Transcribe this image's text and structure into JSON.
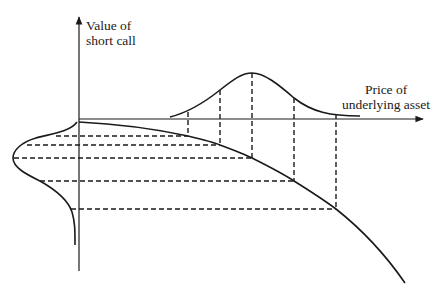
{
  "diagram": {
    "type": "option-value-distribution",
    "y_axis": {
      "label_line1": "Value of",
      "label_line2": "short call"
    },
    "x_axis": {
      "label_line1": "Price of",
      "label_line2": "underlying asset"
    },
    "colors": {
      "stroke": "#1a1a1a",
      "background": "#ffffff"
    },
    "elements": [
      "asset price distribution (bell curve above x-axis)",
      "short call value curve (concave, decreasing)",
      "value distribution (skewed bell curve left of y-axis)",
      "5 vertical dashed projection lines",
      "5 horizontal dashed projection lines"
    ]
  }
}
